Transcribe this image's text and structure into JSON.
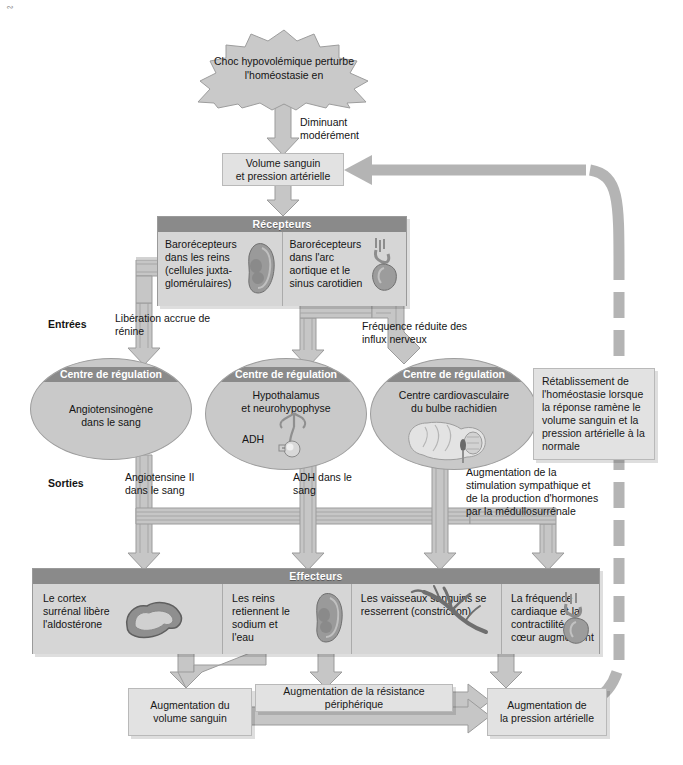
{
  "diagram": {
    "stimulus": {
      "text": "Choc hypovolémique perturbe l'homéostasie en"
    },
    "stimulus_arrow_label": "Diminuant\nmodérément",
    "stimulus_arrow_label_line1": "Diminuant",
    "stimulus_arrow_label_line2": "modérément",
    "variable_box": {
      "line1": "Volume sanguin",
      "line2": "et pression artérielle"
    },
    "receptors": {
      "header": "Récepteurs",
      "cells": [
        {
          "text": "Barorécepteurs dans les reins (cellules juxta-glomérulaires)",
          "icon": "kidney-icon"
        },
        {
          "text": "Barorécepteurs dans l'arc aortique et le sinus carotidien",
          "icon": "heart-aorta-icon"
        }
      ]
    },
    "flow_labels": {
      "inputs": "Entrées",
      "outputs": "Sorties",
      "renin": "Libération accrue de rénine",
      "nerve": "Fréquence réduite des influx nerveux",
      "angiotensin": "Angiotensine II dans le sang",
      "adh": "ADH dans le sang",
      "sympathetic": "Augmentation de la stimulation sympathique et de la production d'hormones par la médullosurrénale"
    },
    "control_centers": [
      {
        "header": "Centre de régulation",
        "line1": "Angiotensinogène",
        "line2": "dans le sang",
        "icon": "none"
      },
      {
        "header": "Centre de régulation",
        "line1": "Hypothalamus",
        "line2": "et neurohypophyse",
        "sub": "ADH",
        "icon": "pituitary-icon"
      },
      {
        "header": "Centre de régulation",
        "line1": "Centre cardiovasculaire",
        "line2": "du bulbe rachidien",
        "icon": "brainstem-icon"
      }
    ],
    "restore_box": {
      "text": "Rétablissement de l'homéostasie lorsque la réponse ramène le volume sanguin et la pression artérielle à la normale"
    },
    "effectors": {
      "header": "Effecteurs",
      "cells": [
        {
          "text": "Le cortex surrénal libère l'aldostérone",
          "icon": "adrenal-cortex-icon"
        },
        {
          "text": "Les reins retiennent le sodium et l'eau",
          "icon": "kidney-icon"
        },
        {
          "text": "Les vaisseaux sanguins se resserrent (constriction)",
          "icon": "blood-vessel-icon"
        },
        {
          "text": "La fréquence cardiaque et la contractilité du cœur augmentent",
          "icon": "heart-icon"
        }
      ]
    },
    "results": [
      {
        "line1": "Augmentation du",
        "line2": "volume sanguin"
      },
      {
        "line1": "Augmentation de la résistance périphérique",
        "line2": ""
      },
      {
        "line1": "Augmentation de",
        "line2": "la pression artérielle"
      }
    ],
    "colors": {
      "panel_fill": "#d2d2d2",
      "header_band": "#8a8a8a",
      "cell_fill": "#d6d6d6",
      "light_box": "#e2e2e2",
      "arrow_fill": "#c6c6c6",
      "arrow_stroke": "#9b9b9b",
      "feedback_arrow": "#b4b4b4",
      "ellipse_fill": "#c9c9c9",
      "page_bg": "#ffffff"
    }
  }
}
